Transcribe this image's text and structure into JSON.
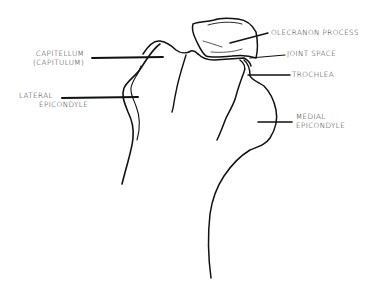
{
  "diagram": {
    "stroke_color": "#111111",
    "background_color": "#ffffff",
    "labels": [
      {
        "id": "capitellum",
        "lines": [
          "CAPITELLUM",
          "(CAPITULUM)"
        ],
        "side": "left"
      },
      {
        "id": "lateral_epicondyle",
        "lines": [
          "LATERAL",
          "EPICONDYLE"
        ],
        "side": "left"
      },
      {
        "id": "olecranon_process",
        "lines": [
          "OLECRANON PROCESS"
        ],
        "side": "right"
      },
      {
        "id": "joint_space",
        "lines": [
          "JOINT SPACE"
        ],
        "side": "right"
      },
      {
        "id": "trochlea",
        "lines": [
          "TROCHLEA"
        ],
        "side": "right"
      },
      {
        "id": "medial_epicondyle",
        "lines": [
          "MEDIAL",
          "EPICONDYLE"
        ],
        "side": "right"
      }
    ]
  }
}
